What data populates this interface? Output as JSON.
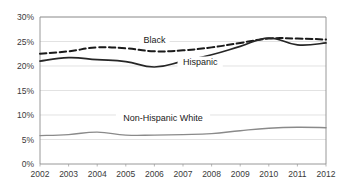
{
  "chart_data": {
    "type": "line",
    "title": "",
    "subtitle": "",
    "xlabel": "",
    "ylabel": "",
    "grid": true,
    "legend_position": "inline-labels",
    "x": [
      2002,
      2003,
      2004,
      2005,
      2006,
      2007,
      2008,
      2009,
      2010,
      2011,
      2012
    ],
    "xtick_labels": [
      "2002",
      "2003",
      "2004",
      "2005",
      "2006",
      "2007",
      "2008",
      "2009",
      "2010",
      "2011",
      "2012"
    ],
    "ytick_labels": [
      "0%",
      "5%",
      "10%",
      "15%",
      "20%",
      "25%",
      "30%"
    ],
    "ytick_values": [
      0,
      5,
      10,
      15,
      20,
      25,
      30
    ],
    "ylim": [
      0,
      30
    ],
    "xlim": [
      2002,
      2012
    ],
    "y_unit": "%",
    "series": [
      {
        "name": "Black",
        "label": "Black",
        "style": "dashed",
        "color": "#1a1a1a",
        "width": 2.0,
        "values": [
          22.5,
          23.0,
          23.8,
          23.6,
          23.0,
          23.2,
          23.8,
          24.7,
          25.6,
          25.6,
          25.4
        ],
        "label_x": 2006.0,
        "label_y": 24.6
      },
      {
        "name": "Hispanic",
        "label": "Hispanic",
        "style": "solid",
        "color": "#262626",
        "width": 1.7,
        "values": [
          21.0,
          21.7,
          21.3,
          20.9,
          19.8,
          21.0,
          22.3,
          24.0,
          25.7,
          24.3,
          24.7
        ],
        "label_x": 2007.6,
        "label_y": 20.3
      },
      {
        "name": "Non-Hispanic White",
        "label": "Non-Hispanic White",
        "style": "solid",
        "color": "#8a8a8a",
        "width": 1.4,
        "values": [
          5.8,
          6.0,
          6.5,
          5.9,
          5.9,
          6.0,
          6.2,
          6.8,
          7.3,
          7.5,
          7.4
        ],
        "label_x": 2006.3,
        "label_y": 8.7
      }
    ],
    "plot_area": {
      "left": 40,
      "top": 17,
      "right": 326,
      "bottom": 164
    },
    "colors": {
      "gridline": "#d6d6d6",
      "axis": "#8d8d8d",
      "background": "#ffffff",
      "text": "#3a3a3a"
    }
  }
}
